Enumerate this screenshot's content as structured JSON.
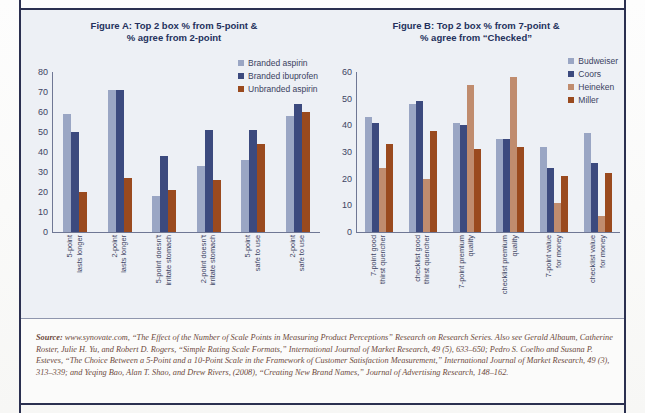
{
  "colors": {
    "budweiser": "#9aa6c4",
    "coors": "#3c4a7e",
    "heineken": "#c08c6e",
    "miller": "#9a4a1e",
    "branded_aspirin": "#9aa6c4",
    "branded_ibuprofen": "#3c4a7e",
    "unbranded_aspirin": "#9a4a1e",
    "axis": "#6f7794",
    "title": "#24305c",
    "panel_bg": "#edf0f5",
    "frame": "#2b3050",
    "source_text": "#6d4a3c"
  },
  "chart_data": [
    {
      "id": "figure-a",
      "type": "bar",
      "title": "Figure A: Top 2 box % from 5-point & % agree from 2-point",
      "title_line1": "Figure A: Top 2 box % from 5-point &",
      "title_line2": "% agree from 2-point",
      "xlabel": "",
      "ylabel": "",
      "ylim": [
        0,
        80
      ],
      "yticks": [
        80,
        70,
        60,
        50,
        40,
        30,
        20,
        10,
        0
      ],
      "grid": false,
      "legend_position": "top-right",
      "categories": [
        "5-point lasts longer",
        "2-point lasts longer",
        "5-point doesn't irritate stomach",
        "2-point doesn't irritate stomach",
        "5-point safe to use",
        "2-point safe to use"
      ],
      "categories_lines": [
        [
          "5-point",
          "lasts longer"
        ],
        [
          "2-point",
          "lasts longer"
        ],
        [
          "5-point doesn't",
          "irritate stomach"
        ],
        [
          "2-point doesn't",
          "irritate stomach"
        ],
        [
          "5-point",
          "safe to use"
        ],
        [
          "2-point",
          "safe to use"
        ]
      ],
      "series": [
        {
          "name": "Branded aspirin",
          "color": "#9aa6c4",
          "values": [
            59,
            71,
            18,
            33,
            36,
            58
          ]
        },
        {
          "name": "Branded ibuprofen",
          "color": "#3c4a7e",
          "values": [
            50,
            71,
            38,
            51,
            51,
            64
          ]
        },
        {
          "name": "Unbranded aspirin",
          "color": "#9a4a1e",
          "values": [
            20,
            27,
            21,
            26,
            44,
            60
          ]
        }
      ]
    },
    {
      "id": "figure-b",
      "type": "bar",
      "title": "Figure B: Top 2 box % from 7-point & % agree from “Checked”",
      "title_line1": "Figure B: Top 2 box % from 7-point &",
      "title_line2": "% agree from “Checked”",
      "xlabel": "",
      "ylabel": "",
      "ylim": [
        0,
        60
      ],
      "yticks": [
        60,
        50,
        40,
        30,
        20,
        10,
        0
      ],
      "grid": false,
      "legend_position": "top-right",
      "categories": [
        "7-point good thirst quencher",
        "checklist good thirst quencher",
        "7-point premium quality",
        "checklist premium quality",
        "7-point value for money",
        "checklist value for money"
      ],
      "categories_lines": [
        [
          "7-point good",
          "thirst quencher"
        ],
        [
          "checklist good",
          "thirst quencher"
        ],
        [
          "7-point premium",
          "quality"
        ],
        [
          "checklist premium",
          "quality"
        ],
        [
          "7-point value",
          "for money"
        ],
        [
          "checklist value",
          "for money"
        ]
      ],
      "series": [
        {
          "name": "Budweiser",
          "color": "#9aa6c4",
          "values": [
            43,
            48,
            41,
            35,
            32,
            37
          ]
        },
        {
          "name": "Coors",
          "color": "#3c4a7e",
          "values": [
            41,
            49,
            40,
            35,
            24,
            26
          ]
        },
        {
          "name": "Heineken",
          "color": "#c08c6e",
          "values": [
            24,
            20,
            55,
            58,
            11,
            6
          ]
        },
        {
          "name": "Miller",
          "color": "#9a4a1e",
          "values": [
            33,
            38,
            31,
            32,
            21,
            22
          ]
        }
      ]
    }
  ],
  "source": {
    "label": "Source:",
    "text": " www.synovate.com, “The Effect of the Number of Scale Points in Measuring Product Perceptions” Research on Research Series. Also see Gerald Albaum, Catherine Roster, Julie H. Yu, and Robert D. Rogers, “Simple Rating Scale Formats,” International Journal of Market Research, 49 (5), 633–650; Pedro S. Coelho and Susana P. Esteves, “The Choice Between a 5-Point and a 10-Point Scale in the Framework of Customer Satisfaction Measurement,” International Journal of Market Research, 49 (3), 313–339; and Yeqing Bao, Alan T. Shao, and Drew Rivers, (2008), “Creating New Brand Names,” Journal of Advertising Research, 148–162."
  }
}
